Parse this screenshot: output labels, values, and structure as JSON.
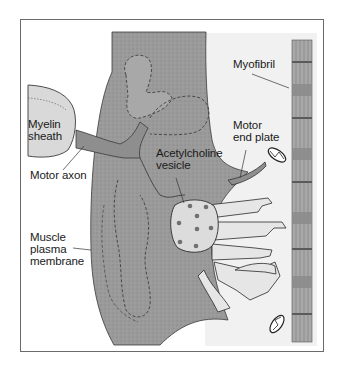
{
  "figure": {
    "labels": {
      "myofibril": "Myofibril",
      "myelin_sheath_1": "Myelin",
      "myelin_sheath_2": "sheath",
      "motor_end_plate_1": "Motor",
      "motor_end_plate_2": "end plate",
      "acetylcholine_vesicle_1": "Acetylcholine",
      "acetylcholine_vesicle_2": "vesicle",
      "motor_axon": "Motor axon",
      "muscle_plasma_membrane_1": "Muscle",
      "muscle_plasma_membrane_2": "plasma",
      "muscle_plasma_membrane_3": "membrane"
    },
    "colors": {
      "muscle_fill": "#9a9a9a",
      "axon_fill": "#8e8e8e",
      "myelin_fill": "#d8d8d8",
      "vesicle_fill": "#dcdcdc",
      "vesicle_dot": "#707070",
      "background_panel": "#efefef",
      "outline": "#2a2a2a",
      "myofibril_fill": "#a8a8a8",
      "frame_border": "#6a6a6a"
    },
    "vesicle_dot_count": 8
  }
}
